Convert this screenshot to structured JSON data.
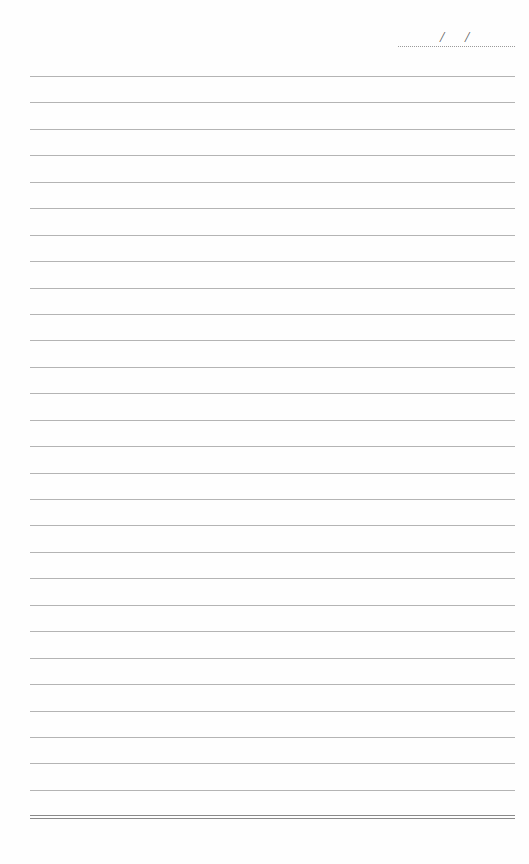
{
  "page": {
    "type": "ruled notebook page",
    "background": "#fefefe",
    "rule_color": "#b4b4b4",
    "bottom_rule_color": "#8a8a8a"
  },
  "date_field": {
    "separators": [
      "/",
      "/"
    ],
    "value": ""
  },
  "rules": {
    "count": 28,
    "first_y": 76,
    "spacing": 26.44,
    "left": 30,
    "right": 515
  },
  "bottom_rule": {
    "y": 815,
    "style": "double"
  }
}
